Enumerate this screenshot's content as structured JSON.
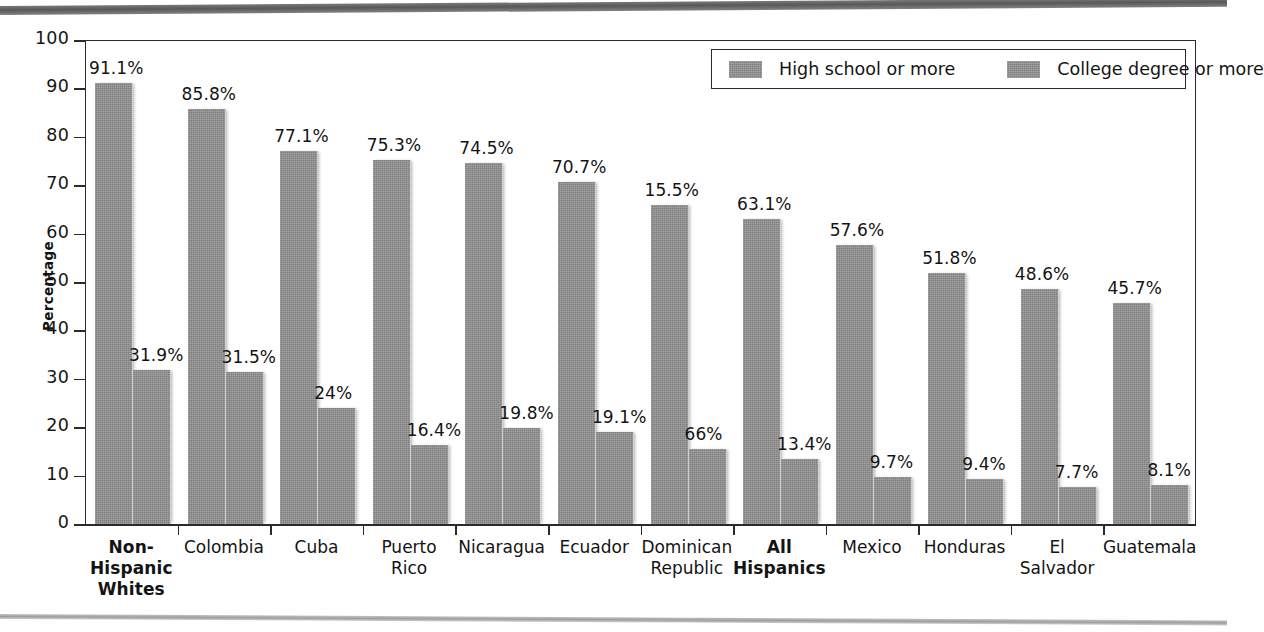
{
  "chart_data": {
    "type": "bar",
    "title": "",
    "xlabel": "",
    "ylabel": "Percentage",
    "ylim": [
      0,
      100
    ],
    "ytick_step": 10,
    "yticks": [
      "100",
      "90",
      "80",
      "70",
      "60",
      "50",
      "40",
      "30",
      "20",
      "10",
      "0"
    ],
    "grid": false,
    "legend_position": "top-right",
    "bar_color": "#8e8e8e",
    "axis_color": "#2b2b2b",
    "categories": [
      "Non-Hispanic Whites",
      "Colombia",
      "Cuba",
      "Puerto Rico",
      "Nicaragua",
      "Ecuador",
      "Dominican Republic",
      "All Hispanics",
      "Mexico",
      "Honduras",
      "El Salvador",
      "Guatemala"
    ],
    "category_lines": [
      [
        "Non-",
        "Hispanic",
        "Whites"
      ],
      [
        "Colombia"
      ],
      [
        "Cuba"
      ],
      [
        "Puerto",
        "Rico"
      ],
      [
        "Nicaragua"
      ],
      [
        "Ecuador"
      ],
      [
        "Dominican",
        "Republic"
      ],
      [
        "All",
        "Hispanics"
      ],
      [
        "Mexico"
      ],
      [
        "Honduras"
      ],
      [
        "El",
        "Salvador"
      ],
      [
        "Guatemala"
      ]
    ],
    "category_bold": [
      true,
      false,
      false,
      false,
      false,
      false,
      false,
      true,
      false,
      false,
      false,
      false
    ],
    "series": [
      {
        "name": "High school or more",
        "values": [
          91.1,
          85.8,
          77.1,
          75.3,
          74.5,
          70.7,
          66.0,
          63.1,
          57.6,
          51.8,
          48.6,
          45.7
        ],
        "labels": [
          "91.1%",
          "85.8%",
          "77.1%",
          "75.3%",
          "74.5%",
          "70.7%",
          "15.5%",
          "63.1%",
          "57.6%",
          "51.8%",
          "48.6%",
          "45.7%"
        ]
      },
      {
        "name": "College degree or more",
        "values": [
          31.9,
          31.5,
          24.0,
          16.4,
          19.8,
          19.1,
          15.5,
          13.4,
          9.7,
          9.4,
          7.7,
          8.1
        ],
        "labels": [
          "31.9%",
          "31.5%",
          "24%",
          "16.4%",
          "19.8%",
          "19.1%",
          "66%",
          "13.4%",
          "9.7%",
          "9.4%",
          "7.7%",
          "8.1%"
        ]
      }
    ]
  },
  "legend": {
    "items": [
      {
        "label": "High school or more"
      },
      {
        "label": "College degree or more"
      }
    ]
  },
  "axis": {
    "y_title": "Percentage"
  }
}
